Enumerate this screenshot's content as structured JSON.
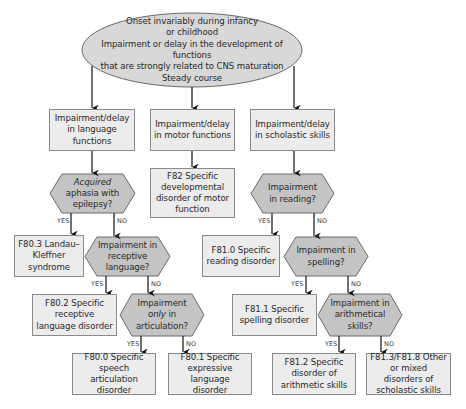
{
  "colors": {
    "box_fill": "#ececec",
    "hex_fill": "#c4c4c4",
    "oval_fill": "#d8d8d8",
    "stroke": "#6a6a6a",
    "arrow": "#111111",
    "text": "#2a2a2a"
  },
  "root": {
    "lines": [
      "Onset invariably during infancy",
      "or childhood",
      "Impairment or delay in the development of functions",
      "that are strongly related to CNS maturation",
      "Steady course"
    ]
  },
  "branches": {
    "language": {
      "title": "Impairment/delay in language functions",
      "q1": {
        "italic": "Acquired",
        "rest": " aphasia with epilepsy?",
        "yes_label": "YES",
        "no_label": "NO"
      },
      "q1_yes": "F80.3 Landau–Kleffner syndrome",
      "q2": {
        "text": "Impairment in receptive language?",
        "yes_label": "YES",
        "no_label": "NO"
      },
      "q2_yes": "F80.2 Specific receptive language disorder",
      "q3": {
        "pre": "Impairment ",
        "italic": "only",
        "post": " in articulation?",
        "yes_label": "YES",
        "no_label": "NO"
      },
      "q3_yes": "F80.0 Specific speech articulation disorder",
      "q3_no": "F80.1 Specific expressive language disorder"
    },
    "motor": {
      "title": "Impairment/delay in motor functions",
      "result": "F82 Specific developmental disorder of motor function"
    },
    "scholastic": {
      "title": "Impairment/delay in scholastic skills",
      "q1": {
        "text": "Impairment in reading?",
        "yes_label": "YES",
        "no_label": "NO"
      },
      "q1_yes": "F81.0 Specific reading disorder",
      "q2": {
        "text": "Impairment in spelling?",
        "yes_label": "YES",
        "no_label": "NO"
      },
      "q2_yes": "F81.1 Specific spelling disorder",
      "q3": {
        "text": "Impairment in arithmetical skills?",
        "yes_label": "YES",
        "no_label": "NO"
      },
      "q3_yes": "F81.2 Specific disorder of arithmetic skills",
      "q3_no": "F81.3/F81.8 Other or mixed disorders of scholastic skills"
    }
  }
}
